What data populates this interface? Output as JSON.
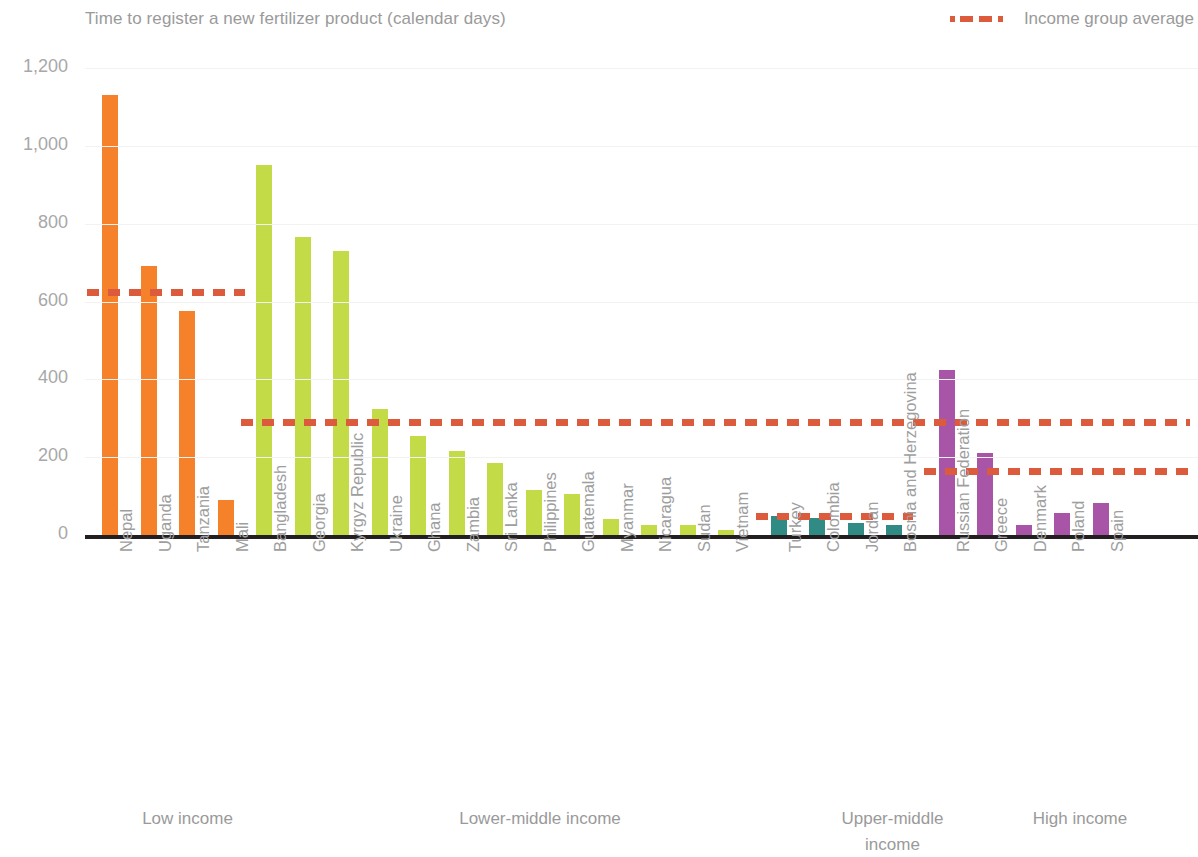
{
  "header": {
    "title": "Time to register a new fertilizer product (calendar days)",
    "legend": {
      "label": "Income group average",
      "color": "#dd5b3d",
      "style": "dashed"
    }
  },
  "axis": {
    "y_ticks": [
      "0",
      "200",
      "400",
      "600",
      "800",
      "1,000",
      "1,200"
    ]
  },
  "group_labels": {
    "low": "Low income",
    "lower_middle": "Lower-middle income",
    "upper_middle_line1": "Upper-middle",
    "upper_middle_line2": "income",
    "high": "High income"
  },
  "colors": {
    "low_income": "#f5822a",
    "lower_middle_income": "#c2db46",
    "upper_middle_income": "#2f8b83",
    "high_income": "#a855a8",
    "average_line": "#dd5b3d",
    "axis": "#231f20",
    "text": "#9a9a9a",
    "gridline": "#f2f2f2"
  },
  "chart_data": {
    "type": "bar",
    "title": "Time to register a new fertilizer product (calendar days)",
    "xlabel": "",
    "ylabel": "",
    "ylim": [
      0,
      1200
    ],
    "ytick_step": 200,
    "grid": true,
    "legend": [
      "Income group average"
    ],
    "legend_position": "top-right",
    "categories": [
      "Nepal",
      "Uganda",
      "Tanzania",
      "Mali",
      "Bangladesh",
      "Georgia",
      "Kyrgyz Republic",
      "Ukraine",
      "Ghana",
      "Zambia",
      "Sri Lanka",
      "Philippines",
      "Guatemala",
      "Myanmar",
      "Nicaragua",
      "Sudan",
      "Vietnam",
      "Turkey",
      "Colombia",
      "Jordan",
      "Bosnia and Herzegovina",
      "Russian Federation",
      "Greece",
      "Denmark",
      "Poland",
      "Spain"
    ],
    "values": [
      1130,
      690,
      575,
      90,
      950,
      765,
      730,
      325,
      255,
      215,
      185,
      115,
      105,
      40,
      25,
      25,
      12,
      48,
      45,
      32,
      25,
      425,
      212,
      25,
      57,
      82
    ],
    "groups": [
      {
        "name": "Low income",
        "color": "#f5822a",
        "start": 0,
        "count": 4,
        "average": 625
      },
      {
        "name": "Lower-middle income",
        "color": "#c2db46",
        "start": 4,
        "count": 13,
        "average": 290
      },
      {
        "name": "Upper-middle income",
        "color": "#2f8b83",
        "start": 17,
        "count": 4,
        "average": 48
      },
      {
        "name": "High income",
        "color": "#a855a8",
        "start": 21,
        "count": 5,
        "average": 165
      }
    ],
    "annotations": {
      "average_series_name": "Income group average"
    }
  }
}
